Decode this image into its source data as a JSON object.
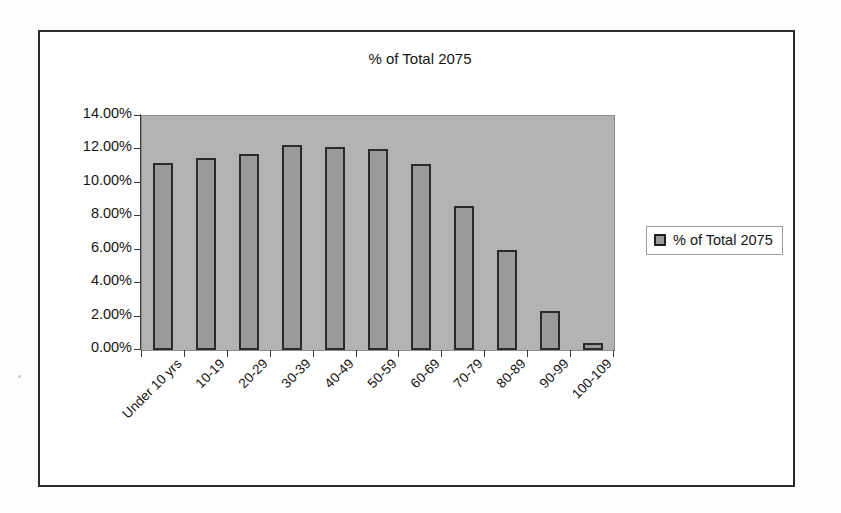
{
  "chart_data": {
    "type": "bar",
    "title": "% of Total 2075",
    "xlabel": "",
    "ylabel": "",
    "categories": [
      "Under 10 yrs",
      "10-19",
      "20-29",
      "30-39",
      "40-49",
      "50-59",
      "60-69",
      "70-79",
      "80-89",
      "90-99",
      "100-109"
    ],
    "series": [
      {
        "name": "% of Total 2075",
        "values": [
          11.2,
          11.5,
          11.75,
          12.25,
          12.15,
          12.0,
          11.1,
          8.6,
          6.0,
          2.35,
          0.4
        ]
      }
    ],
    "ylim": [
      0,
      14
    ],
    "ytick_values": [
      0,
      2,
      4,
      6,
      8,
      10,
      12,
      14
    ],
    "ytick_labels": [
      "0.00%",
      "2.00%",
      "4.00%",
      "6.00%",
      "8.00%",
      "10.00%",
      "12.00%",
      "14.00%"
    ],
    "grid": false,
    "legend": {
      "position": "right",
      "entries": [
        "% of Total 2075"
      ]
    },
    "colors": {
      "bar_fill": "#9a9a9a",
      "bar_border": "#2a2a2a",
      "plot_background": "#b3b3b3",
      "frame_border": "#2b2b2b",
      "text": "#141414"
    }
  }
}
